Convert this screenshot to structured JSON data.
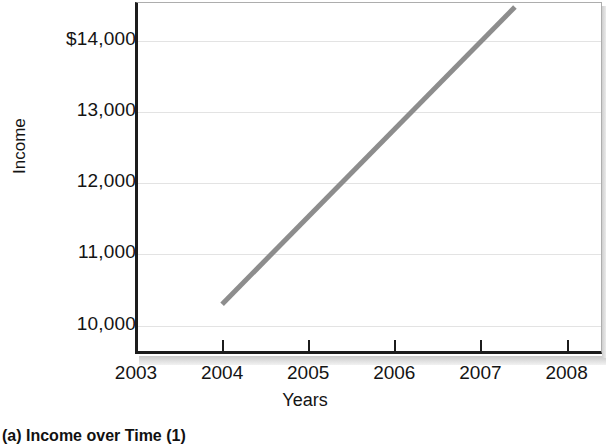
{
  "figure": {
    "caption": "(a)  Income over Time (1)"
  },
  "chart_data": {
    "type": "line",
    "title": "",
    "xlabel": "Years",
    "ylabel": "Income",
    "xlim": [
      2003,
      2008.4
    ],
    "ylim": [
      9600,
      14550
    ],
    "grid": true,
    "legend": "none",
    "x_tick_labels": [
      "2003",
      "2004",
      "2005",
      "2006",
      "2007",
      "2008"
    ],
    "x_tick_values": [
      2003,
      2004,
      2005,
      2006,
      2007,
      2008
    ],
    "y_tick_labels": [
      "$14,000",
      "13,000",
      "12,000",
      "11,000",
      "10,000"
    ],
    "y_tick_values": [
      14000,
      13000,
      12000,
      11000,
      10000
    ],
    "series": [
      {
        "name": "Income",
        "color": "#8d8d8d",
        "x": [
          2004,
          2007.4
        ],
        "values": [
          10300,
          14480
        ]
      }
    ]
  },
  "axis": {
    "y_ticks": [
      {
        "label": "$14,000",
        "value": 14000
      },
      {
        "label": "13,000",
        "value": 13000
      },
      {
        "label": "12,000",
        "value": 12000
      },
      {
        "label": "11,000",
        "value": 11000
      },
      {
        "label": "10,000",
        "value": 10000
      }
    ],
    "x_ticks": [
      {
        "label": "2003",
        "value": 2003
      },
      {
        "label": "2004",
        "value": 2004
      },
      {
        "label": "2005",
        "value": 2005
      },
      {
        "label": "2006",
        "value": 2006
      },
      {
        "label": "2007",
        "value": 2007
      },
      {
        "label": "2008",
        "value": 2008
      }
    ]
  },
  "colors": {
    "line": "#8d8d8d",
    "grid": "#e3e3e3",
    "axis": "#1c1c1c",
    "frame": "#adadad",
    "text": "#141414"
  }
}
